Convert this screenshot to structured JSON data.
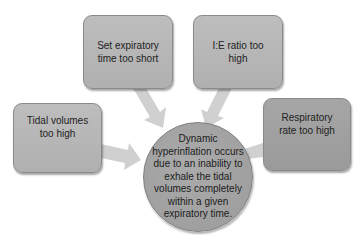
{
  "diagram": {
    "type": "convergent-causes",
    "colors": {
      "box_fill": "#b8b8b8",
      "box_dark_fill": "#a0a0a0",
      "circle_fill": "#a3a3a3",
      "arrow_fill": "#cfcfcf",
      "text": "#222222"
    },
    "causes": [
      {
        "id": "set-expiratory-time",
        "label": "Set expiratory time too short"
      },
      {
        "id": "ie-ratio",
        "label": "I:E ratio too high"
      },
      {
        "id": "tidal-volumes",
        "label": "Tidal volumes too high"
      },
      {
        "id": "respiratory-rate",
        "label": "Respiratory rate too high"
      }
    ],
    "center": {
      "label": "Dynamic hyperinflation occurs due to an inability to exhale the tidal volumes completely within a given expiratory time."
    }
  }
}
